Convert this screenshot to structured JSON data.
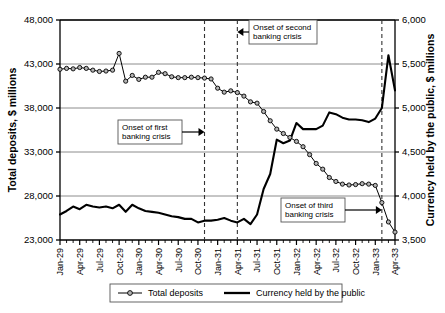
{
  "chart_data": {
    "type": "line",
    "title": "",
    "subtitle": "",
    "xlabel": "",
    "ylabel": "Total deposits, $ millions",
    "y2label": "Currency held by the public, $ millions",
    "grid": true,
    "legend_position": "bottom",
    "ylim": [
      23000,
      48000
    ],
    "yticks": [
      "23,000",
      "28,000",
      "33,000",
      "38,000",
      "43,000",
      "48,000"
    ],
    "ytick_values": [
      23000,
      28000,
      33000,
      38000,
      43000,
      48000
    ],
    "y2lim": [
      3500,
      6000
    ],
    "y2ticks": [
      "3,500",
      "4,000",
      "4,500",
      "5,000",
      "5,500",
      "6,000"
    ],
    "y2tick_values": [
      3500,
      4000,
      4500,
      5000,
      5500,
      6000
    ],
    "xtick_labels": [
      "Jan-29",
      "Apr-29",
      "Jul-29",
      "Oct-29",
      "Jan-30",
      "Apr-30",
      "Jul-30",
      "Oct-30",
      "Jan-31",
      "Apr-31",
      "Jul-31",
      "Oct-31",
      "Jan-32",
      "Apr-32",
      "Jul-32",
      "Oct-32",
      "Jan-33",
      "Apr-33"
    ],
    "x_months": [
      "Jan-29",
      "Feb-29",
      "Mar-29",
      "Apr-29",
      "May-29",
      "Jun-29",
      "Jul-29",
      "Aug-29",
      "Sep-29",
      "Oct-29",
      "Nov-29",
      "Dec-29",
      "Jan-30",
      "Feb-30",
      "Mar-30",
      "Apr-30",
      "May-30",
      "Jun-30",
      "Jul-30",
      "Aug-30",
      "Sep-30",
      "Oct-30",
      "Nov-30",
      "Dec-30",
      "Jan-31",
      "Feb-31",
      "Mar-31",
      "Apr-31",
      "May-31",
      "Jun-31",
      "Jul-31",
      "Aug-31",
      "Sep-31",
      "Oct-31",
      "Nov-31",
      "Dec-31",
      "Jan-32",
      "Feb-32",
      "Mar-32",
      "Apr-32",
      "May-32",
      "Jun-32",
      "Jul-32",
      "Aug-32",
      "Sep-32",
      "Oct-32",
      "Nov-32",
      "Dec-32",
      "Jan-33",
      "Feb-33",
      "Mar-33",
      "Apr-33"
    ],
    "series": [
      {
        "name": "Total deposits",
        "axis": "left",
        "marker": "circle",
        "color": "#000000",
        "values": [
          42400,
          42500,
          42450,
          42600,
          42500,
          42300,
          42150,
          42200,
          42300,
          44200,
          41050,
          41700,
          41250,
          41500,
          41500,
          42050,
          41900,
          41550,
          41450,
          41450,
          41500,
          41450,
          41400,
          41300,
          40250,
          39800,
          39950,
          39750,
          39350,
          38700,
          38550,
          37600,
          36550,
          35600,
          35100,
          34650,
          34200,
          33600,
          32700,
          31700,
          31050,
          30100,
          29650,
          29350,
          29250,
          29300,
          29400,
          29350,
          29200,
          27250,
          25050,
          23900
        ]
      },
      {
        "name": "Currency held by the public",
        "axis": "right",
        "marker": "none",
        "color": "#000000",
        "values": [
          3790,
          3830,
          3880,
          3850,
          3900,
          3880,
          3870,
          3880,
          3860,
          3900,
          3820,
          3900,
          3860,
          3830,
          3820,
          3810,
          3790,
          3770,
          3760,
          3740,
          3740,
          3700,
          3720,
          3720,
          3730,
          3750,
          3720,
          3700,
          3740,
          3680,
          3790,
          4080,
          4250,
          4640,
          4600,
          4630,
          4830,
          4760,
          4760,
          4760,
          4800,
          4950,
          4930,
          4890,
          4870,
          4870,
          4860,
          4840,
          4880,
          5000,
          5600,
          5200
        ]
      }
    ],
    "annotations": [
      {
        "id": "first-crisis",
        "text_line1": "Onset of first",
        "text_line2": "banking crisis",
        "x_month": "Nov-30",
        "arrow": "right"
      },
      {
        "id": "second-crisis",
        "text_line1": "Onset of second",
        "text_line2": "banking crisis",
        "x_month": "Apr-31",
        "arrow": "left"
      },
      {
        "id": "third-crisis",
        "text_line1": "Onset of third",
        "text_line2": "banking crisis",
        "x_month": "Feb-33",
        "arrow": "right"
      }
    ],
    "legend": [
      {
        "label": "Total deposits",
        "marker": "circle-line"
      },
      {
        "label": "Currency held by the public",
        "marker": "thick-line"
      }
    ]
  }
}
